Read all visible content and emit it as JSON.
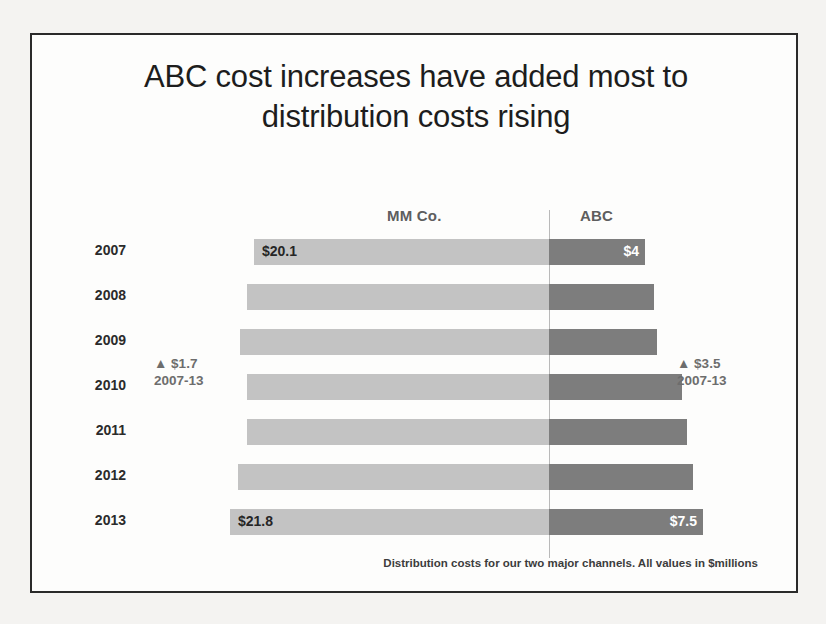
{
  "slide": {
    "title_line1": "ABC cost increases have added most to",
    "title_line2": "distribution costs rising",
    "footnote": "Distribution costs for our two major channels. All values in $millions"
  },
  "chart_data": {
    "type": "bar",
    "subtype": "diverging-tornado",
    "title": "ABC cost increases have added most to distribution costs rising",
    "xlabel": "",
    "ylabel": "",
    "unit": "$millions",
    "grid": false,
    "legend_position": "top-column-headers",
    "categories": [
      "2007",
      "2008",
      "2009",
      "2010",
      "2011",
      "2012",
      "2013"
    ],
    "series": [
      {
        "name": "MM Co.",
        "direction": "left",
        "color": "#c3c3c3",
        "values": [
          20.1,
          20.4,
          20.8,
          20.4,
          20.4,
          21.0,
          21.8
        ],
        "labels": [
          "$20.1",
          "",
          "",
          "",
          "",
          "",
          "$21.8"
        ]
      },
      {
        "name": "ABC",
        "direction": "right",
        "color": "#7d7d7d",
        "values": [
          4.0,
          5.0,
          5.2,
          7.0,
          7.2,
          7.4,
          7.5
        ],
        "labels": [
          "$4",
          "",
          "",
          "",
          "",
          "",
          "$7.5"
        ]
      }
    ],
    "annotations": [
      {
        "id": "mm-delta",
        "delta": "▲ $1.7",
        "span": "2007-13",
        "series": "MM Co."
      },
      {
        "id": "abc-delta",
        "delta": "▲ $3.5",
        "span": "2007-13",
        "series": "ABC"
      }
    ]
  },
  "headers": {
    "left": "MM Co.",
    "right": "ABC"
  },
  "rows": [
    {
      "year": "2007",
      "left_start": 222,
      "left_width": 295,
      "right_width": 96,
      "left_label": "$20.1",
      "right_label": "$4"
    },
    {
      "year": "2008",
      "left_start": 215,
      "left_width": 302,
      "right_width": 105,
      "left_label": "",
      "right_label": ""
    },
    {
      "year": "2009",
      "left_start": 208,
      "left_width": 309,
      "right_width": 108,
      "left_label": "",
      "right_label": ""
    },
    {
      "year": "2010",
      "left_start": 215,
      "left_width": 302,
      "right_width": 133,
      "left_label": "",
      "right_label": ""
    },
    {
      "year": "2011",
      "left_start": 215,
      "left_width": 302,
      "right_width": 138,
      "left_label": "",
      "right_label": ""
    },
    {
      "year": "2012",
      "left_start": 206,
      "left_width": 311,
      "right_width": 144,
      "left_label": "",
      "right_label": ""
    },
    {
      "year": "2013",
      "left_start": 198,
      "left_width": 319,
      "right_width": 154,
      "left_label": "$21.8",
      "right_label": "$7.5"
    }
  ]
}
